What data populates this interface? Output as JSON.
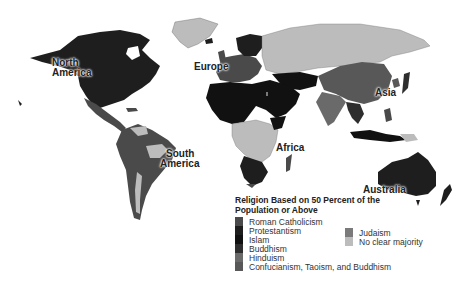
{
  "map": {
    "labels": {
      "north_america": "North\nAmerica",
      "north_america_l1": "North",
      "north_america_l2": "America",
      "south_america_l1": "South",
      "south_america_l2": "America",
      "europe": "Europe",
      "asia": "Asia",
      "africa": "Africa",
      "australia": "Australia"
    },
    "colors": {
      "roman_catholicism": "#4a4a4a",
      "protestantism": "#1e1e1e",
      "islam": "#111111",
      "buddhism": "#2e2e2e",
      "hinduism": "#6a6a6a",
      "confucianism": "#585858",
      "judaism": "#7a7a7a",
      "no_clear_majority": "#bcbcbc"
    }
  },
  "legend": {
    "title_line1": "Religion Based on 50 Percent of the",
    "title_line2": "Population or Above",
    "items": [
      {
        "label": "Roman Catholicism",
        "color": "#4a4a4a"
      },
      {
        "label": "Protestantism",
        "color": "#1e1e1e"
      },
      {
        "label": "Islam",
        "color": "#111111"
      },
      {
        "label": "Buddhism",
        "color": "#2e2e2e"
      },
      {
        "label": "Hinduism",
        "color": "#6a6a6a"
      },
      {
        "label": "Confucianism, Taoism, and Buddhism",
        "color": "#585858"
      },
      {
        "label": "Judaism",
        "color": "#7a7a7a"
      },
      {
        "label": "No clear majority",
        "color": "#bcbcbc"
      }
    ]
  }
}
